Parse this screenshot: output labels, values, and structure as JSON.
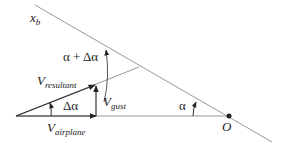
{
  "labels": {
    "xb": "x",
    "xb_sub": "b",
    "alpha_plus_dalpha": "α + Δα",
    "v_resultant": "V",
    "v_resultant_sub": "resultant",
    "delta_alpha": "Δα",
    "v_gust": "V",
    "v_gust_sub": "gust",
    "v_airplane": "V",
    "v_airplane_sub": "airplane",
    "alpha": "α",
    "origin": "O"
  },
  "colors": {
    "line": "#888888",
    "vector": "#333333",
    "text": "#222222"
  }
}
